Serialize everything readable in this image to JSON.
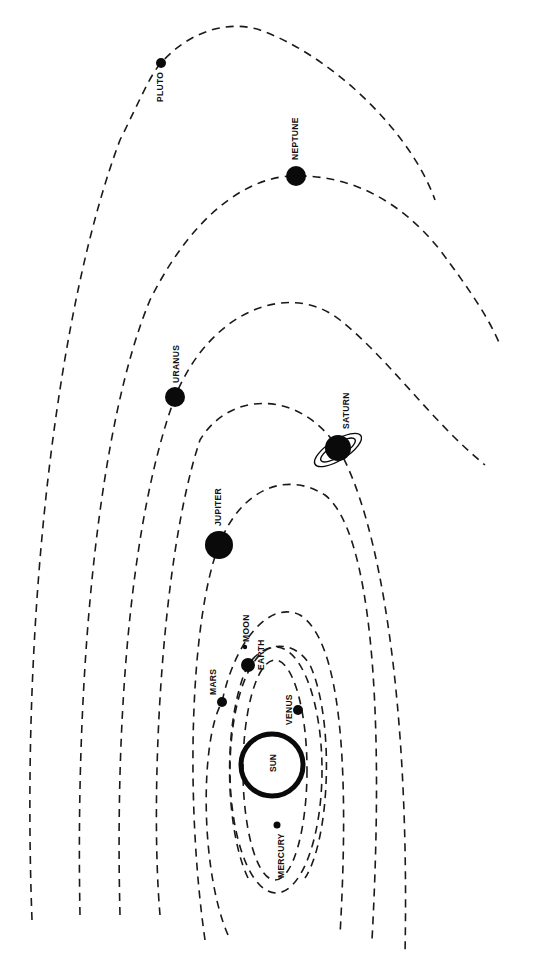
{
  "diagram": {
    "sun": {
      "label": "SUN",
      "cx": 272,
      "cy": 765,
      "r": 31
    },
    "planets": [
      {
        "name": "mercury",
        "label": "MERCURY",
        "cx": 277,
        "cy": 825,
        "r": 3.5
      },
      {
        "name": "venus",
        "label": "VENUS",
        "cx": 298,
        "cy": 710,
        "r": 5
      },
      {
        "name": "earth",
        "label": "EARTH",
        "cx": 248,
        "cy": 665,
        "r": 7
      },
      {
        "name": "moon",
        "label": "MOON",
        "cx": 245,
        "cy": 647,
        "r": 2.2
      },
      {
        "name": "mars",
        "label": "MARS",
        "cx": 222,
        "cy": 702,
        "r": 5
      },
      {
        "name": "jupiter",
        "label": "JUPITER",
        "cx": 219,
        "cy": 545,
        "r": 14
      },
      {
        "name": "saturn",
        "label": "SATURN",
        "cx": 338,
        "cy": 448,
        "r": 13
      },
      {
        "name": "uranus",
        "label": "URANUS",
        "cx": 175,
        "cy": 397,
        "r": 10
      },
      {
        "name": "neptune",
        "label": "NEPTUNE",
        "cx": 296,
        "cy": 176,
        "r": 10
      },
      {
        "name": "pluto",
        "label": "PLUTO",
        "cx": 161,
        "cy": 63,
        "r": 5
      }
    ],
    "colors": {
      "ink": "#0a0a0a",
      "background": "#ffffff"
    }
  }
}
